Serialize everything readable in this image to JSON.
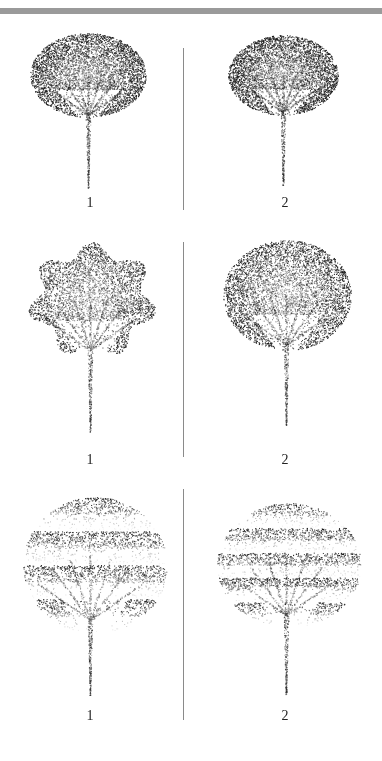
{
  "figure": {
    "rows": [
      {
        "divider": {
          "top": 48,
          "height": 162
        },
        "panels": [
          {
            "label": "1",
            "left": 0,
            "top": 40,
            "height": 170,
            "label_x": 80,
            "label_y": 195,
            "crown": {
              "cx": 88,
              "cy": 75,
              "rx": 58,
              "ry": 42
            },
            "trunk_top": 115,
            "trunk_bottom": 188,
            "trunk_x": 88,
            "style": "dense",
            "seed": 11
          },
          {
            "label": "2",
            "left": 191,
            "top": 40,
            "height": 170,
            "label_x": 84,
            "label_y": 195,
            "crown": {
              "cx": 92,
              "cy": 75,
              "rx": 55,
              "ry": 40
            },
            "trunk_top": 112,
            "trunk_bottom": 185,
            "trunk_x": 92,
            "style": "dense-fan",
            "seed": 23
          }
        ]
      },
      {
        "divider": {
          "top": 242,
          "height": 215
        },
        "panels": [
          {
            "label": "1",
            "left": 0,
            "top": 240,
            "height": 225,
            "label_x": 80,
            "label_y": 452,
            "crown": {
              "cx": 92,
              "cy": 300,
              "rx": 65,
              "ry": 58
            },
            "trunk_top": 350,
            "trunk_bottom": 432,
            "trunk_x": 90,
            "style": "lobed",
            "seed": 37
          },
          {
            "label": "2",
            "left": 191,
            "top": 240,
            "height": 225,
            "label_x": 84,
            "label_y": 452,
            "crown": {
              "cx": 96,
              "cy": 295,
              "rx": 64,
              "ry": 55
            },
            "trunk_top": 345,
            "trunk_bottom": 425,
            "trunk_x": 95,
            "style": "dense",
            "seed": 41
          }
        ]
      },
      {
        "divider": {
          "top": 489,
          "height": 231
        },
        "panels": [
          {
            "label": "1",
            "left": 0,
            "top": 470,
            "height": 270,
            "label_x": 80,
            "label_y": 708,
            "crown": {
              "cx": 95,
              "cy": 565,
              "rx": 72,
              "ry": 68
            },
            "trunk_top": 620,
            "trunk_bottom": 695,
            "trunk_x": 90,
            "style": "layered",
            "seed": 53
          },
          {
            "label": "2",
            "left": 191,
            "top": 470,
            "height": 270,
            "label_x": 84,
            "label_y": 708,
            "crown": {
              "cx": 98,
              "cy": 565,
              "rx": 72,
              "ry": 62
            },
            "trunk_top": 615,
            "trunk_bottom": 695,
            "trunk_x": 95,
            "style": "tiered",
            "seed": 67
          }
        ]
      }
    ]
  }
}
